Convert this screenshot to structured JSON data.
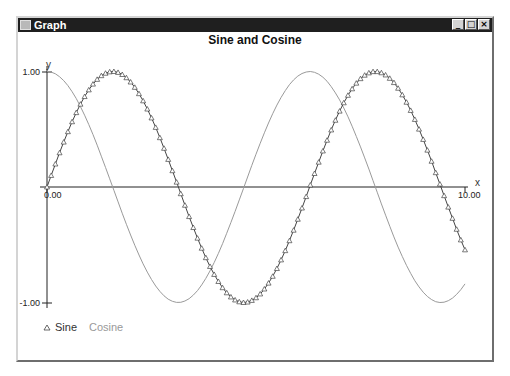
{
  "window": {
    "title": "Graph",
    "buttons": {
      "minimize": "_",
      "maximize": "□",
      "close": "×"
    }
  },
  "chart_data": {
    "type": "line",
    "title": "Sine and Cosine",
    "xlabel": "x",
    "ylabel": "y",
    "xlim": [
      0,
      10
    ],
    "ylim": [
      -1,
      1
    ],
    "x_tick_labels": [
      "0.00",
      "10.00"
    ],
    "y_tick_labels": [
      "1.00",
      "-1.00"
    ],
    "grid": false,
    "legend_position": "bottom-left",
    "x_step": 0.1,
    "x": [
      0.0,
      0.1,
      0.2,
      0.3,
      0.4,
      0.5,
      0.6,
      0.7,
      0.8,
      0.9,
      1.0,
      1.1,
      1.2,
      1.3,
      1.4,
      1.5,
      1.6,
      1.7,
      1.8,
      1.9,
      2.0,
      2.1,
      2.2,
      2.3,
      2.4,
      2.5,
      2.6,
      2.7,
      2.8,
      2.9,
      3.0,
      3.1,
      3.2,
      3.3,
      3.4,
      3.5,
      3.6,
      3.7,
      3.8,
      3.9,
      4.0,
      4.1,
      4.2,
      4.3,
      4.4,
      4.5,
      4.6,
      4.7,
      4.8,
      4.9,
      5.0,
      5.1,
      5.2,
      5.3,
      5.4,
      5.5,
      5.6,
      5.7,
      5.8,
      5.9,
      6.0,
      6.1,
      6.2,
      6.3,
      6.4,
      6.5,
      6.6,
      6.7,
      6.8,
      6.9,
      7.0,
      7.1,
      7.2,
      7.3,
      7.4,
      7.5,
      7.6,
      7.7,
      7.8,
      7.9,
      8.0,
      8.1,
      8.2,
      8.3,
      8.4,
      8.5,
      8.6,
      8.7,
      8.8,
      8.9,
      9.0,
      9.1,
      9.2,
      9.3,
      9.4,
      9.5,
      9.6,
      9.7,
      9.8,
      9.9,
      10.0
    ],
    "series": [
      {
        "name": "Sine",
        "marker": "triangle",
        "color": "#444444",
        "values": [
          0.0,
          0.1,
          0.199,
          0.296,
          0.389,
          0.479,
          0.565,
          0.644,
          0.717,
          0.783,
          0.841,
          0.891,
          0.932,
          0.964,
          0.985,
          0.997,
          1.0,
          0.992,
          0.974,
          0.946,
          0.909,
          0.863,
          0.808,
          0.746,
          0.675,
          0.598,
          0.516,
          0.427,
          0.335,
          0.239,
          0.141,
          0.042,
          -0.058,
          -0.158,
          -0.256,
          -0.351,
          -0.443,
          -0.53,
          -0.612,
          -0.688,
          -0.757,
          -0.818,
          -0.872,
          -0.916,
          -0.952,
          -0.978,
          -0.994,
          -1.0,
          -0.996,
          -0.982,
          -0.959,
          -0.926,
          -0.883,
          -0.832,
          -0.773,
          -0.706,
          -0.631,
          -0.551,
          -0.465,
          -0.374,
          -0.279,
          -0.182,
          -0.083,
          0.017,
          0.117,
          0.215,
          0.312,
          0.405,
          0.494,
          0.578,
          0.657,
          0.729,
          0.794,
          0.85,
          0.899,
          0.938,
          0.968,
          0.988,
          0.999,
          0.999,
          0.989,
          0.97,
          0.941,
          0.904,
          0.855,
          0.798,
          0.734,
          0.663,
          0.585,
          0.501,
          0.412,
          0.319,
          0.223,
          0.124,
          0.025,
          -0.075,
          -0.174,
          -0.271,
          -0.366,
          -0.458,
          -0.544
        ]
      },
      {
        "name": "Cosine",
        "marker": "none",
        "color": "#9a9a9a",
        "values": [
          1.0,
          0.995,
          0.98,
          0.955,
          0.921,
          0.878,
          0.825,
          0.765,
          0.697,
          0.622,
          0.54,
          0.454,
          0.362,
          0.267,
          0.17,
          0.071,
          -0.029,
          -0.129,
          -0.227,
          -0.323,
          -0.416,
          -0.505,
          -0.589,
          -0.666,
          -0.737,
          -0.801,
          -0.857,
          -0.904,
          -0.942,
          -0.971,
          -0.99,
          -0.999,
          -0.998,
          -0.987,
          -0.967,
          -0.936,
          -0.897,
          -0.848,
          -0.791,
          -0.726,
          -0.654,
          -0.575,
          -0.49,
          -0.401,
          -0.307,
          -0.211,
          -0.112,
          -0.012,
          0.087,
          0.187,
          0.284,
          0.378,
          0.469,
          0.554,
          0.635,
          0.709,
          0.776,
          0.835,
          0.886,
          0.927,
          0.96,
          0.983,
          0.996,
          1.0,
          0.993,
          0.977,
          0.951,
          0.915,
          0.869,
          0.815,
          0.754,
          0.684,
          0.608,
          0.526,
          0.438,
          0.347,
          0.252,
          0.155,
          0.055,
          -0.045,
          -0.146,
          -0.244,
          -0.34,
          -0.432,
          -0.52,
          -0.602,
          -0.679,
          -0.748,
          -0.811,
          -0.865,
          -0.911,
          -0.948,
          -0.975,
          -0.993,
          -1.0,
          -0.997,
          -0.984,
          -0.962,
          -0.93,
          -0.889,
          -0.839
        ]
      }
    ]
  }
}
